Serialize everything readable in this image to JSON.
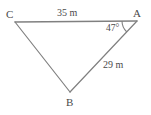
{
  "figure": {
    "type": "triangle-diagram",
    "background_color": "#ffffff",
    "stroke_color": "#808080",
    "text_color": "#4a4a4a"
  },
  "vertices": [
    {
      "name": "C",
      "label": "C",
      "x": 15,
      "y": 22
    },
    {
      "name": "A",
      "label": "A",
      "x": 137,
      "y": 21
    },
    {
      "name": "B",
      "label": "B",
      "x": 70,
      "y": 92
    }
  ],
  "sides": [
    {
      "name": "CA",
      "label": "35 m",
      "from": "C",
      "to": "A",
      "length_value": 35,
      "unit": "m"
    },
    {
      "name": "AB",
      "label": "29 m",
      "from": "A",
      "to": "B",
      "length_value": 29,
      "unit": "m"
    },
    {
      "name": "CB",
      "label": "",
      "from": "C",
      "to": "B",
      "length_value": null,
      "unit": ""
    }
  ],
  "angles": [
    {
      "name": "angle-A",
      "at_vertex": "A",
      "label": "47°",
      "value": 47,
      "unit": "degrees",
      "marker": "arc"
    }
  ]
}
